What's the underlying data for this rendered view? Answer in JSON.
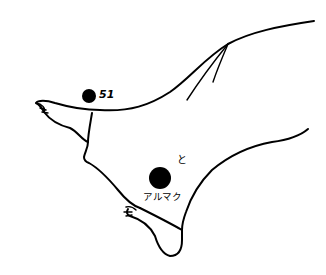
{
  "figure": {
    "colors": {
      "line": "#000000",
      "background": "#ffffff",
      "point": "#000000"
    }
  },
  "points": [
    {
      "id": "point-51",
      "label": "51",
      "cx": 89,
      "cy": 96,
      "r": 7
    },
    {
      "id": "point-arumaku",
      "label": "アルマク",
      "mark": "と",
      "cx": 160,
      "cy": 178,
      "r": 11
    }
  ]
}
